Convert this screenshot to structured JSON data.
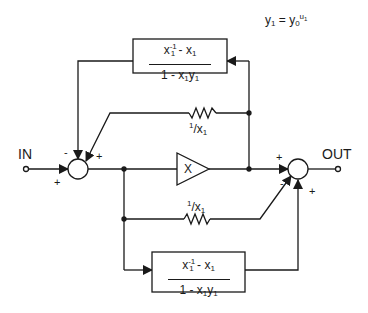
{
  "equation": {
    "lhs": "y",
    "lhs_sub": "1",
    "eq": " = y",
    "base_sub": "0",
    "exp": "u",
    "exp_sub": "1"
  },
  "terminals": {
    "input": "IN",
    "output": "OUT"
  },
  "blocks": {
    "top_filter": {
      "num_main": "x",
      "num_sub": "1",
      "num_sup": "-1",
      "num_rest": "- x",
      "num_rest_sub": "1",
      "den_main": "1 - x",
      "den_sub1": "1",
      "den_y": "y",
      "den_sub2": "1"
    },
    "bottom_filter": {
      "num_main": "x",
      "num_sub": "1",
      "num_sup": "-1",
      "num_rest": "- x",
      "num_rest_sub": "1",
      "den_main": "1 - x",
      "den_sub1": "1",
      "den_y": "y",
      "den_sub2": "1"
    },
    "amplifier": {
      "label": "X"
    }
  },
  "resistors": {
    "top": {
      "num": "1",
      "slash": "/x",
      "sub": "1"
    },
    "bottom": {
      "num": "1",
      "slash": "/x",
      "sub": "1"
    }
  },
  "summers": {
    "left": {
      "top_left_sign": "-",
      "top_right_sign": "+",
      "input_sign": "+"
    },
    "right": {
      "input_sign": "+",
      "diag_sign": "-",
      "bottom_sign": "+"
    }
  },
  "colors": {
    "line": "#1a1a1a",
    "background": "#ffffff"
  }
}
